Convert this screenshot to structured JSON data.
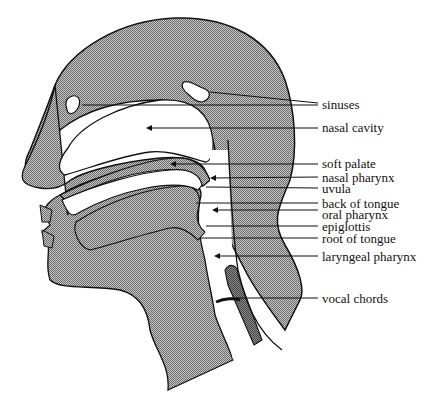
{
  "diagram": {
    "fill_color": "#a8a8a8",
    "line_color": "#111111",
    "labels": [
      {
        "id": "sinuses",
        "text": "sinuses",
        "x": 320,
        "y": 96,
        "target_x": 30,
        "target_y": 105
      },
      {
        "id": "nasal-cavity",
        "text": "nasal cavity",
        "x": 320,
        "y": 121,
        "target_x": 148,
        "target_y": 128
      },
      {
        "id": "soft-palate",
        "text": "soft palate",
        "x": 320,
        "y": 157,
        "target_x": 172,
        "target_y": 164
      },
      {
        "id": "nasal-pharynx",
        "text": "nasal pharynx",
        "x": 320,
        "y": 171,
        "target_x": 210,
        "target_y": 179
      },
      {
        "id": "uvula",
        "text": "uvula",
        "x": 320,
        "y": 184,
        "target_x": 205,
        "target_y": 188
      },
      {
        "id": "back-of-tongue",
        "text": "back of tongue",
        "x": 320,
        "y": 200,
        "target_x": 196,
        "target_y": 203
      },
      {
        "id": "oral-pharynx",
        "text": "oral pharynx",
        "x": 320,
        "y": 212,
        "target_x": 215,
        "target_y": 210
      },
      {
        "id": "epiglottis",
        "text": "epiglottis",
        "x": 320,
        "y": 226,
        "target_x": 206,
        "target_y": 226
      },
      {
        "id": "root-of-tongue",
        "text": "root of tongue",
        "x": 320,
        "y": 238,
        "target_x": 200,
        "target_y": 238
      },
      {
        "id": "laryngeal-pharynx",
        "text": "laryngeal pharynx",
        "x": 320,
        "y": 255,
        "target_x": 215,
        "target_y": 256
      },
      {
        "id": "vocal-chords",
        "text": "vocal chords",
        "x": 320,
        "y": 315,
        "target_x": 238,
        "target_y": 298
      }
    ]
  }
}
